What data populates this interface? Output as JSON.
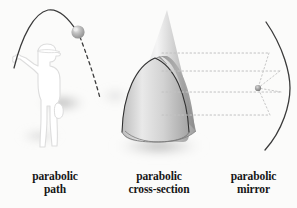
{
  "figure": {
    "background_color": "#fbfbfa",
    "ink_color": "#2b2b2b",
    "caption_color": "#161616"
  },
  "panels": [
    {
      "id": "parabolic-path",
      "caption_line1": "parabolic",
      "caption_line2": "path",
      "elements": {
        "thrower_label": "person throwing ball",
        "ball_label": "ball",
        "ascending_arc_label": "solid parabolic arc",
        "descending_arc_label": "dashed parabolic arc",
        "ground_shadow_label": "ground shadow"
      },
      "colors": {
        "arc": "#3a3a3a",
        "ball_fill": "#a8a8a8",
        "ball_highlight": "#e8e8e8",
        "silhouette_outline": "#d6d6d6",
        "shadow": "#9a9a9a"
      }
    },
    {
      "id": "parabolic-cross-section",
      "caption_line1": "parabolic",
      "caption_line2": "cross-section",
      "elements": {
        "cone_label": "cone",
        "cut_surface_label": "parabolic cut surface",
        "cut_edge_label": "parabola outline",
        "ground_shadow_label": "ground shadow"
      },
      "colors": {
        "cone_light": "#f2f2f2",
        "cone_mid": "#c9c9c9",
        "cone_dark": "#8f8f8f",
        "cut_face_light": "#ededed",
        "cut_face_dark": "#a0a0a0",
        "cut_edge": "#2f2f2f",
        "shadow": "#a5a5a5"
      }
    },
    {
      "id": "parabolic-mirror",
      "caption_line1": "parabolic",
      "caption_line2": "mirror",
      "elements": {
        "mirror_arc_label": "parabolic mirror arc",
        "incoming_rays_label": "incoming parallel rays",
        "reflected_rays_label": "reflected rays",
        "focus_label": "focal point"
      },
      "ray_count": 4,
      "colors": {
        "arc": "#3a3a3a",
        "ray": "#bdbdbd",
        "focus": "#8c8c8c"
      }
    }
  ]
}
